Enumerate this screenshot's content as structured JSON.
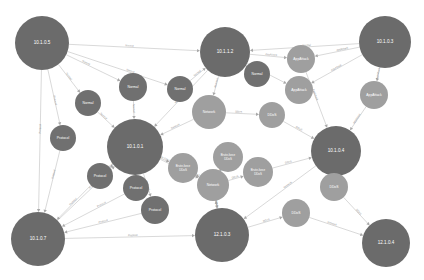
{
  "diagram": {
    "type": "network-attack-graph",
    "background": "#ffffff",
    "palette": {
      "host_node": "#6b6b6b",
      "mid_node": "#707070",
      "light_node": "#9f9f9f",
      "edge": "#b9b9b9",
      "edge_label_text": "#8f8f8f",
      "node_label_text": "#ffffff"
    },
    "nodes": [
      {
        "id": "h1",
        "label": "10.1.0.5",
        "x": 42,
        "y": 43,
        "r": 27,
        "color": "#6b6b6b",
        "kind": "host"
      },
      {
        "id": "h2",
        "label": "10.1.1.2",
        "x": 225,
        "y": 52,
        "r": 25,
        "color": "#6b6b6b",
        "kind": "host"
      },
      {
        "id": "h3",
        "label": "10.1.0.3",
        "x": 385,
        "y": 42,
        "r": 26,
        "color": "#6b6b6b",
        "kind": "host"
      },
      {
        "id": "h4",
        "label": "10.1.0.1",
        "x": 135,
        "y": 147,
        "r": 28,
        "color": "#6b6b6b",
        "kind": "host"
      },
      {
        "id": "h5",
        "label": "10.1.0.4",
        "x": 336,
        "y": 151,
        "r": 25,
        "color": "#6b6b6b",
        "kind": "host"
      },
      {
        "id": "h6",
        "label": "10.1.0.7",
        "x": 38,
        "y": 239,
        "r": 27,
        "color": "#6b6b6b",
        "kind": "host"
      },
      {
        "id": "h7",
        "label": "12.1.0.3",
        "x": 222,
        "y": 235,
        "r": 27,
        "color": "#6b6b6b",
        "kind": "host"
      },
      {
        "id": "h8",
        "label": "12.1.0.4",
        "x": 386,
        "y": 243,
        "r": 24,
        "color": "#6b6b6b",
        "kind": "host"
      },
      {
        "id": "n1",
        "label": "Normal",
        "x": 133,
        "y": 87,
        "r": 14,
        "color": "#707070",
        "kind": "traffic"
      },
      {
        "id": "n2",
        "label": "Normal",
        "x": 88,
        "y": 103,
        "r": 13,
        "color": "#707070",
        "kind": "traffic"
      },
      {
        "id": "n3",
        "label": "Normal",
        "x": 180,
        "y": 89,
        "r": 13,
        "color": "#707070",
        "kind": "traffic"
      },
      {
        "id": "n4",
        "label": "Normal",
        "x": 257,
        "y": 74,
        "r": 13,
        "color": "#707070",
        "kind": "traffic"
      },
      {
        "id": "n5",
        "label": "Protocol",
        "x": 63,
        "y": 138,
        "r": 13,
        "color": "#707070",
        "kind": "traffic"
      },
      {
        "id": "n6",
        "label": "Protocol",
        "x": 100,
        "y": 176,
        "r": 13,
        "color": "#707070",
        "kind": "traffic"
      },
      {
        "id": "n7",
        "label": "Protocol",
        "x": 136,
        "y": 188,
        "r": 13,
        "color": "#707070",
        "kind": "traffic"
      },
      {
        "id": "n8",
        "label": "Protocol",
        "x": 155,
        "y": 210,
        "r": 14,
        "color": "#707070",
        "kind": "traffic"
      },
      {
        "id": "a1",
        "label": "AppAttack",
        "x": 301,
        "y": 59,
        "r": 14,
        "color": "#9f9f9f",
        "kind": "attack"
      },
      {
        "id": "a2",
        "label": "AppAttack",
        "x": 299,
        "y": 90,
        "r": 14,
        "color": "#9f9f9f",
        "kind": "attack"
      },
      {
        "id": "a3",
        "label": "AppAttack",
        "x": 374,
        "y": 95,
        "r": 14,
        "color": "#9f9f9f",
        "kind": "attack"
      },
      {
        "id": "w1",
        "label": "Network",
        "x": 209,
        "y": 112,
        "r": 17,
        "color": "#9f9f9f",
        "kind": "service"
      },
      {
        "id": "w2",
        "label": "Network",
        "x": 213,
        "y": 185,
        "r": 16,
        "color": "#9f9f9f",
        "kind": "service"
      },
      {
        "id": "d1",
        "label": "DDoS",
        "x": 272,
        "y": 115,
        "r": 13,
        "color": "#9f9f9f",
        "kind": "attack"
      },
      {
        "id": "d2",
        "label": "DDoS",
        "x": 334,
        "y": 187,
        "r": 14,
        "color": "#9f9f9f",
        "kind": "attack"
      },
      {
        "id": "d3",
        "label": "DDoS",
        "x": 296,
        "y": 213,
        "r": 14,
        "color": "#9f9f9f",
        "kind": "attack"
      },
      {
        "id": "b1",
        "label": "Brute-force DDoS",
        "x": 183,
        "y": 168,
        "r": 15,
        "color": "#9f9f9f",
        "kind": "attack"
      },
      {
        "id": "b2",
        "label": "Brute-force DDoS",
        "x": 228,
        "y": 157,
        "r": 15,
        "color": "#9f9f9f",
        "kind": "attack"
      },
      {
        "id": "b3",
        "label": "Brute-force DDoS",
        "x": 258,
        "y": 172,
        "r": 15,
        "color": "#9f9f9f",
        "kind": "attack"
      }
    ],
    "edges": [
      {
        "from": "h1",
        "to": "n1",
        "label": "Normal"
      },
      {
        "from": "h1",
        "to": "n2",
        "label": "Normal"
      },
      {
        "from": "h1",
        "to": "n3",
        "label": "Normal"
      },
      {
        "from": "h1",
        "to": "h2",
        "label": "Normal"
      },
      {
        "from": "h1",
        "to": "n5",
        "label": "Protocol"
      },
      {
        "from": "h1",
        "to": "h6",
        "label": "Protocol"
      },
      {
        "from": "n1",
        "to": "h4",
        "label": "Normal"
      },
      {
        "from": "n2",
        "to": "h4",
        "label": "Normal"
      },
      {
        "from": "n3",
        "to": "h2",
        "label": "Normal"
      },
      {
        "from": "n4",
        "to": "h2",
        "label": "Normal"
      },
      {
        "from": "h2",
        "to": "w1",
        "label": "Network"
      },
      {
        "from": "h2",
        "to": "a1",
        "label": "AppAttack"
      },
      {
        "from": "h2",
        "to": "a2",
        "label": "AppAttack"
      },
      {
        "from": "h2",
        "to": "h4",
        "label": "Normal"
      },
      {
        "from": "h3",
        "to": "a1",
        "label": "AppAttack"
      },
      {
        "from": "h3",
        "to": "a2",
        "label": "AppAttack"
      },
      {
        "from": "h3",
        "to": "a3",
        "label": "AppAttack"
      },
      {
        "from": "h3",
        "to": "h2",
        "label": "Normal"
      },
      {
        "from": "a3",
        "to": "h5",
        "label": "AppAttack"
      },
      {
        "from": "a1",
        "to": "h5",
        "label": "AppAttack"
      },
      {
        "from": "w1",
        "to": "h4",
        "label": "Network"
      },
      {
        "from": "w1",
        "to": "d1",
        "label": "DDoS"
      },
      {
        "from": "d1",
        "to": "h5",
        "label": "DDoS"
      },
      {
        "from": "h4",
        "to": "n6",
        "label": "Protocol"
      },
      {
        "from": "h4",
        "to": "n7",
        "label": "Protocol"
      },
      {
        "from": "h4",
        "to": "n8",
        "label": "Protocol"
      },
      {
        "from": "h4",
        "to": "b1",
        "label": "Brute-force"
      },
      {
        "from": "h4",
        "to": "w2",
        "label": "Network"
      },
      {
        "from": "n5",
        "to": "h6",
        "label": "Protocol"
      },
      {
        "from": "n6",
        "to": "h6",
        "label": "Protocol"
      },
      {
        "from": "n7",
        "to": "h6",
        "label": "Protocol"
      },
      {
        "from": "n8",
        "to": "h6",
        "label": "Protocol"
      },
      {
        "from": "h6",
        "to": "h4",
        "label": "Protocol"
      },
      {
        "from": "b1",
        "to": "w2",
        "label": "DDoS"
      },
      {
        "from": "b2",
        "to": "w2",
        "label": "DDoS"
      },
      {
        "from": "b3",
        "to": "h5",
        "label": "DDoS"
      },
      {
        "from": "w2",
        "to": "h7",
        "label": "Network"
      },
      {
        "from": "w2",
        "to": "b2",
        "label": "DDoS"
      },
      {
        "from": "w2",
        "to": "b3",
        "label": "DDoS"
      },
      {
        "from": "h7",
        "to": "w2",
        "label": "Network"
      },
      {
        "from": "h5",
        "to": "d2",
        "label": "DDoS"
      },
      {
        "from": "d2",
        "to": "h8",
        "label": "DDoS"
      },
      {
        "from": "d3",
        "to": "h8",
        "label": "Network"
      },
      {
        "from": "h7",
        "to": "d3",
        "label": "DDoS"
      },
      {
        "from": "h5",
        "to": "h7",
        "label": "Network"
      },
      {
        "from": "h6",
        "to": "h7",
        "label": "Protocol"
      }
    ]
  }
}
